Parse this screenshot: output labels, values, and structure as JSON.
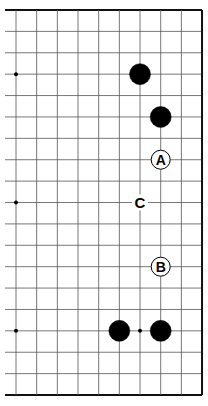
{
  "diagram": {
    "type": "go-board-fragment",
    "columns": 10,
    "rows": 19,
    "origin_x": 16,
    "origin_y": 10,
    "spacing_x": 20.67,
    "spacing_y": 21.39,
    "left_overhang": 11,
    "edges": {
      "top": true,
      "right": true,
      "bottom": true,
      "left": false
    },
    "line_color": "#555555",
    "edge_color": "#111111",
    "star_points": [
      {
        "col": 0,
        "row": 3
      },
      {
        "col": 0,
        "row": 9
      },
      {
        "col": 0,
        "row": 15
      },
      {
        "col": 6,
        "row": 15
      }
    ],
    "stones": [
      {
        "col": 6,
        "row": 3,
        "color": "black"
      },
      {
        "col": 7,
        "row": 5,
        "color": "black"
      },
      {
        "col": 5,
        "row": 15,
        "color": "black"
      },
      {
        "col": 7,
        "row": 15,
        "color": "black"
      }
    ],
    "labels": [
      {
        "col": 7,
        "row": 7,
        "text": "A",
        "circled": true
      },
      {
        "col": 6,
        "row": 9,
        "text": "C",
        "circled": false
      },
      {
        "col": 7,
        "row": 12,
        "text": "B",
        "circled": true
      }
    ]
  }
}
